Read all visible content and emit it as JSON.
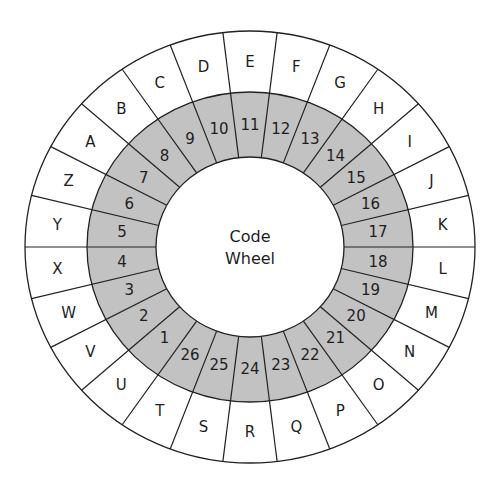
{
  "title": {
    "line1": "Code",
    "line2": "Wheel"
  },
  "colors": {
    "ring_gray": "#c2c2c2",
    "line": "#222222",
    "background": "#ffffff"
  },
  "wheel": {
    "segments": 26,
    "outer_letters": [
      "A",
      "B",
      "C",
      "D",
      "E",
      "F",
      "G",
      "H",
      "I",
      "J",
      "K",
      "L",
      "M",
      "N",
      "O",
      "P",
      "Q",
      "R",
      "S",
      "T",
      "U",
      "V",
      "W",
      "X",
      "Y",
      "Z"
    ],
    "inner_numbers": [
      "7",
      "8",
      "9",
      "10",
      "11",
      "12",
      "13",
      "14",
      "15",
      "16",
      "17",
      "18",
      "19",
      "20",
      "21",
      "22",
      "23",
      "24",
      "25",
      "26",
      "1",
      "2",
      "3",
      "4",
      "5",
      "6"
    ]
  },
  "mapping": [
    {
      "letter": "A",
      "number": 7
    },
    {
      "letter": "B",
      "number": 8
    },
    {
      "letter": "C",
      "number": 9
    },
    {
      "letter": "D",
      "number": 10
    },
    {
      "letter": "E",
      "number": 11
    },
    {
      "letter": "F",
      "number": 12
    },
    {
      "letter": "G",
      "number": 13
    },
    {
      "letter": "H",
      "number": 14
    },
    {
      "letter": "I",
      "number": 15
    },
    {
      "letter": "J",
      "number": 16
    },
    {
      "letter": "K",
      "number": 17
    },
    {
      "letter": "L",
      "number": 18
    },
    {
      "letter": "M",
      "number": 19
    },
    {
      "letter": "N",
      "number": 20
    },
    {
      "letter": "O",
      "number": 21
    },
    {
      "letter": "P",
      "number": 22
    },
    {
      "letter": "Q",
      "number": 23
    },
    {
      "letter": "R",
      "number": 24
    },
    {
      "letter": "S",
      "number": 25
    },
    {
      "letter": "T",
      "number": 26
    },
    {
      "letter": "U",
      "number": 1
    },
    {
      "letter": "V",
      "number": 2
    },
    {
      "letter": "W",
      "number": 3
    },
    {
      "letter": "X",
      "number": 4
    },
    {
      "letter": "Y",
      "number": 5
    },
    {
      "letter": "Z",
      "number": 6
    }
  ]
}
